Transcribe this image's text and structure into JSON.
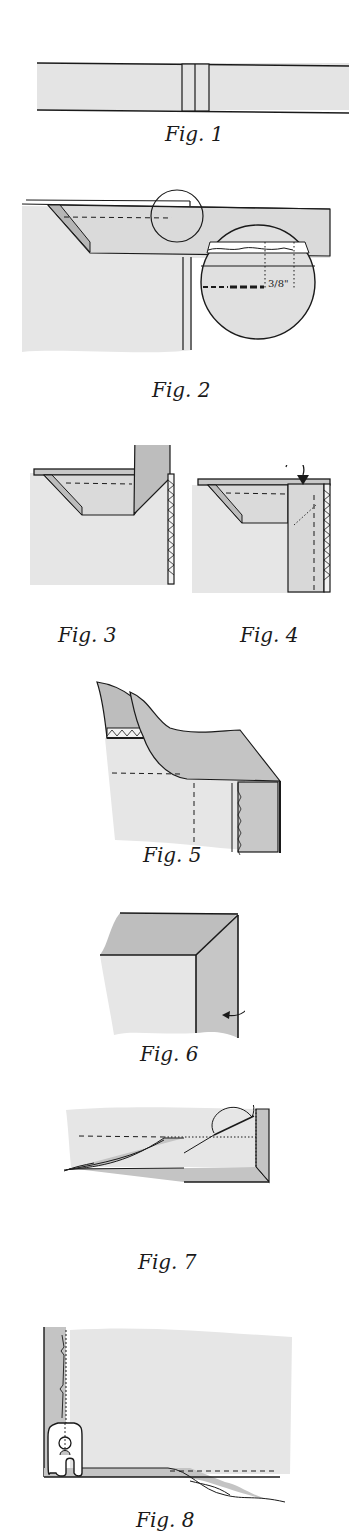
{
  "colors": {
    "light_fabric": "#e6e6e6",
    "dark_fabric": "#c2c2c2",
    "outline": "#1a1a1a",
    "background": "#ffffff"
  },
  "figures": [
    {
      "id": 1,
      "caption": "Fig. 1"
    },
    {
      "id": 2,
      "caption": "Fig. 2",
      "annotation": "3/8\""
    },
    {
      "id": 3,
      "caption": "Fig. 3"
    },
    {
      "id": 4,
      "caption": "Fig. 4"
    },
    {
      "id": 5,
      "caption": "Fig. 5"
    },
    {
      "id": 6,
      "caption": "Fig. 6"
    },
    {
      "id": 7,
      "caption": "Fig. 7"
    },
    {
      "id": 8,
      "caption": "Fig. 8"
    }
  ]
}
